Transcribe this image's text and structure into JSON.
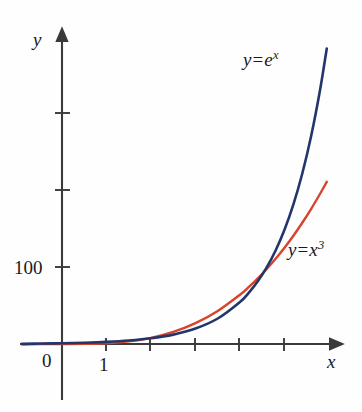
{
  "figure": {
    "background_color": "#fefefe",
    "width": 362,
    "height": 412
  },
  "axes": {
    "x_label": "x",
    "y_label": "y",
    "origin_label": "0",
    "x_tick_labels": [
      "1"
    ],
    "y_tick_labels": [
      "100"
    ],
    "axis_color": "#3a3a3a",
    "origin_px": {
      "x": 62,
      "y": 344
    },
    "x_unit_px": 44.5,
    "y_unit_per_100_px": 77
  },
  "chart_data": {
    "type": "line",
    "title": "",
    "xlabel": "x",
    "ylabel": "y",
    "xlim": [
      -0.95,
      6.15
    ],
    "ylim": [
      -0.9,
      4.0
    ],
    "y_scale_note": "y axis labeled in units of 100",
    "grid": false,
    "legend": "inline-annotations",
    "x_ticks": [
      1,
      2,
      3,
      4,
      5
    ],
    "x_tick_labels": [
      "1",
      "",
      "",
      "",
      ""
    ],
    "y_ticks": [
      100,
      200,
      300
    ],
    "y_tick_labels": [
      "100",
      "",
      ""
    ],
    "annotations": [
      {
        "text": "y = e^x",
        "series": "exp",
        "x": 4.2,
        "y": 3.85
      },
      {
        "text": "y = x^3",
        "series": "cubic",
        "x": 5.3,
        "y": 1.35
      }
    ],
    "series": [
      {
        "name": "y = e^x",
        "label_html": "y = e<sup>x</sup>",
        "color": "#23366b",
        "x": [
          -0.9,
          -0.5,
          0,
          0.5,
          1,
          1.5,
          2,
          2.5,
          3,
          3.5,
          4,
          4.2,
          4.4,
          4.6,
          4.8,
          5,
          5.2,
          5.4,
          5.6,
          5.8,
          5.95
        ],
        "values": [
          0.41,
          0.61,
          1,
          1.65,
          2.72,
          4.48,
          7.39,
          12.18,
          20.09,
          33.12,
          54.6,
          66.7,
          81.45,
          99.48,
          121.51,
          148.41,
          181.27,
          221.41,
          270.43,
          330.3,
          383.75
        ]
      },
      {
        "name": "y = x^3",
        "label_html": "y = x<sup>3</sup>",
        "color": "#d8432b",
        "x": [
          -0.9,
          -0.5,
          0,
          0.5,
          1,
          1.5,
          2,
          2.5,
          3,
          3.5,
          4,
          4.2,
          4.4,
          4.6,
          4.8,
          5,
          5.2,
          5.4,
          5.6,
          5.8,
          5.95
        ],
        "values": [
          -0.73,
          -0.13,
          0,
          0.13,
          1,
          3.38,
          8,
          15.63,
          27,
          42.88,
          64,
          74.09,
          85.18,
          97.34,
          110.59,
          125,
          140.61,
          157.46,
          175.62,
          195.11,
          210.64
        ]
      }
    ]
  }
}
